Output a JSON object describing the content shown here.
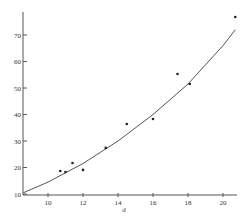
{
  "chart_data": {
    "type": "scatter",
    "title": "",
    "xlabel": "d",
    "ylabel": "",
    "xlim": [
      8.6,
      21
    ],
    "ylim": [
      10,
      78
    ],
    "grid": false,
    "legend": null,
    "x_ticks": [
      10,
      12,
      14,
      16,
      18,
      20
    ],
    "y_ticks": [
      10,
      20,
      30,
      40,
      50,
      60,
      70
    ],
    "series": [
      {
        "name": "observations",
        "kind": "points",
        "x": [
          10.7,
          11.0,
          11.4,
          12.0,
          13.3,
          14.5,
          16.0,
          17.4,
          18.1,
          20.7
        ],
        "y": [
          18.7,
          18.3,
          21.7,
          19.1,
          27.4,
          36.4,
          38.3,
          55.3,
          51.5,
          76.8
        ]
      },
      {
        "name": "fitted curve",
        "kind": "line",
        "x": [
          8.6,
          10,
          12,
          14,
          16,
          18,
          20,
          20.7
        ],
        "y": [
          10.5,
          14.5,
          21.5,
          30.0,
          40.0,
          51.5,
          66.0,
          72.0
        ]
      }
    ]
  },
  "axes": {
    "x_label": "d"
  }
}
